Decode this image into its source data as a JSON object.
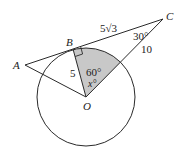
{
  "figure": {
    "points": {
      "A": {
        "label": "A",
        "x": 25,
        "y": 65
      },
      "B": {
        "label": "B",
        "x": 73,
        "y": 49
      },
      "C": {
        "label": "C",
        "x": 163,
        "y": 19
      },
      "O": {
        "label": "O",
        "x": 86,
        "y": 97
      }
    },
    "circle": {
      "center": "O",
      "radius": 49
    },
    "labels": {
      "BC": "5√3",
      "OC": "10",
      "OB": "5",
      "angle_C": "30°",
      "angle_BOC": "60°",
      "angle_x": "x°"
    },
    "colors": {
      "stroke": "#2a2a2a",
      "shade": "#c8c8c8"
    }
  }
}
